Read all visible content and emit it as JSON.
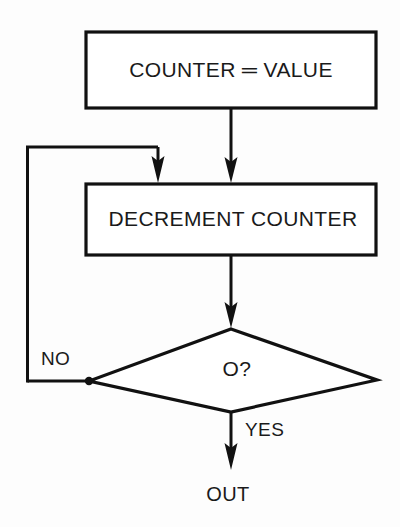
{
  "diagram": {
    "background_color": "#fdfdfd",
    "line_color": "#111111",
    "text_color": "#1a1a1a",
    "nodes": [
      {
        "id": "init",
        "type": "process",
        "label": "COUNTER ═ VALUE"
      },
      {
        "id": "decrement",
        "type": "process",
        "label": "DECREMENT COUNTER"
      },
      {
        "id": "test",
        "type": "decision",
        "label": "O?"
      },
      {
        "id": "out",
        "type": "terminal",
        "label": "OUT"
      }
    ],
    "edges": [
      {
        "id": "init-to-decrement",
        "from": "init",
        "to": "decrement",
        "label": ""
      },
      {
        "id": "decrement-to-test",
        "from": "decrement",
        "to": "test",
        "label": ""
      },
      {
        "id": "test-no-loop",
        "from": "test",
        "to": "decrement",
        "label": "NO"
      },
      {
        "id": "test-yes-out",
        "from": "test",
        "to": "out",
        "label": "YES"
      }
    ]
  }
}
